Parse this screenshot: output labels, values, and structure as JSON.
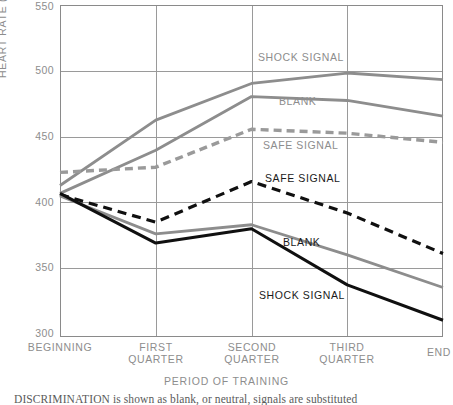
{
  "chart_data": {
    "type": "line",
    "title": "",
    "xlabel": "PERIOD OF TRAINING",
    "ylabel": "HEART RATE (BEATS PER MINUTE)",
    "categories": [
      "BEGINNING",
      "FIRST QUARTER",
      "SECOND QUARTER",
      "THIRD QUARTER",
      "END"
    ],
    "ylim": [
      300,
      550
    ],
    "yticks": [
      550,
      500,
      450,
      400,
      350,
      300
    ],
    "grid": true,
    "legend_position": "inline-labels",
    "series": [
      {
        "name": "SHOCK SIGNAL",
        "group": "upper",
        "color": "#8d8d8d",
        "style": "solid",
        "values": [
          412,
          462,
          490,
          498,
          493
        ],
        "label": "SHOCK SIGNAL",
        "label_color": "#8d8d8d"
      },
      {
        "name": "BLANK",
        "group": "upper",
        "color": "#8d8d8d",
        "style": "solid",
        "values": [
          406,
          439,
          480,
          477,
          465
        ],
        "label": "BLANK",
        "label_color": "#8d8d8d"
      },
      {
        "name": "SAFE SIGNAL",
        "group": "upper",
        "color": "#9a9a9a",
        "style": "dashed",
        "values": [
          422,
          426,
          455,
          452,
          445
        ],
        "label": "SAFE SIGNAL",
        "label_color": "#8d8d8d"
      },
      {
        "name": "SAFE SIGNAL",
        "group": "lower",
        "color": "#101010",
        "style": "dashed",
        "values": [
          405,
          384,
          415,
          391,
          360
        ],
        "label": "SAFE SIGNAL",
        "label_color": "#1a1a1a"
      },
      {
        "name": "BLANK",
        "group": "lower",
        "color": "#8d8d8d",
        "style": "solid",
        "values": [
          404,
          375,
          382,
          359,
          334
        ],
        "label": "BLANK",
        "label_color": "#1a1a1a"
      },
      {
        "name": "SHOCK SIGNAL",
        "group": "lower",
        "color": "#101010",
        "style": "solid",
        "values": [
          406,
          368,
          379,
          336,
          309
        ],
        "label": "SHOCK SIGNAL",
        "label_color": "#1a1a1a"
      }
    ],
    "inline_labels": [
      {
        "text": "SHOCK SIGNAL",
        "x": 258,
        "y": 57,
        "tone": "gray"
      },
      {
        "text": "BLANK",
        "x": 279,
        "y": 101,
        "tone": "gray"
      },
      {
        "text": "SAFE SIGNAL",
        "x": 263,
        "y": 145,
        "tone": "gray"
      },
      {
        "text": "SAFE SIGNAL",
        "x": 265,
        "y": 178,
        "tone": "black"
      },
      {
        "text": "BLANK",
        "x": 283,
        "y": 242,
        "tone": "black"
      },
      {
        "text": "SHOCK SIGNAL",
        "x": 259,
        "y": 295,
        "tone": "black"
      }
    ],
    "ytick_positions": [
      5,
      70.4,
      135.8,
      201.2,
      266.6,
      332
    ],
    "xtick_positions": [
      60,
      155.75,
      251.5,
      347.25,
      443
    ]
  },
  "axes": {
    "y_ticks": [
      "550",
      "500",
      "450",
      "400",
      "350",
      "300"
    ],
    "x_ticks": [
      {
        "line1": "BEGINNING",
        "line2": ""
      },
      {
        "line1": "FIRST",
        "line2": "QUARTER"
      },
      {
        "line1": "SECOND",
        "line2": "QUARTER"
      },
      {
        "line1": "THIRD",
        "line2": "QUARTER"
      },
      {
        "line1": "END",
        "line2": ""
      }
    ],
    "y_axis_title": "HEART RATE (BEATS PER MINUTE)",
    "x_axis_title": "PERIOD OF TRAINING"
  },
  "caption": {
    "text": "DISCRIMINATION is shown as blank, or neutral, signals are substituted"
  },
  "colors": {
    "gray_line": "#8d8d8d",
    "black_line": "#101010",
    "grid": "#9a9a9a",
    "tick_text": "#8d8d8d",
    "frame": "#8a8a8a"
  }
}
